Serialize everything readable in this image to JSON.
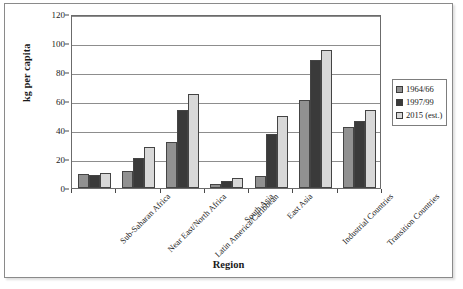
{
  "chart_data": {
    "type": "bar",
    "title": "",
    "xlabel": "Region",
    "ylabel": "kg per capita",
    "ylim": [
      0,
      120
    ],
    "ytick_step": 20,
    "yticks": [
      0,
      20,
      40,
      60,
      80,
      100,
      120
    ],
    "grid": true,
    "legend_position": "right",
    "categories": [
      "Sub-Saharan Africa",
      "Near East/North Africa",
      "Latin America/Caribbean",
      "South Asia",
      "East Asia",
      "Industrial Countries",
      "Transition Countries"
    ],
    "series": [
      {
        "name": "1964/66",
        "color": "#919191",
        "values": [
          9.5,
          11.5,
          31.5,
          3,
          8,
          61,
          42
        ]
      },
      {
        "name": "1997/99",
        "color": "#3a3a3a",
        "values": [
          9,
          21,
          53.5,
          4.5,
          37.5,
          88,
          46
        ]
      },
      {
        "name": "2015 (est.)",
        "color": "#d8d8d8",
        "values": [
          10.5,
          28,
          65,
          7,
          50,
          95.5,
          53.5
        ]
      }
    ]
  }
}
